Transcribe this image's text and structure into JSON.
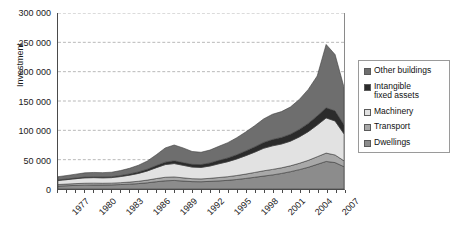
{
  "chart_data": {
    "type": "area",
    "stacked": true,
    "title": "",
    "xlabel": "",
    "ylabel": "Investment",
    "ylim": [
      0,
      300000
    ],
    "ytick_step": 50000,
    "ytick_labels": [
      "300 000",
      "250 000",
      "200 000",
      "150 000",
      "100 000",
      "50 000",
      "0"
    ],
    "ytick_values": [
      300000,
      250000,
      200000,
      150000,
      100000,
      50000,
      0
    ],
    "grid": true,
    "grid_style": "dashed",
    "legend_position": "right",
    "xlim": [
      1977,
      2009
    ],
    "xtick_label_step": 3,
    "x": [
      1977,
      1978,
      1979,
      1980,
      1981,
      1982,
      1983,
      1984,
      1985,
      1986,
      1987,
      1988,
      1989,
      1990,
      1991,
      1992,
      1993,
      1994,
      1995,
      1996,
      1997,
      1998,
      1999,
      2000,
      2001,
      2002,
      2003,
      2004,
      2005,
      2006,
      2007,
      2008,
      2009
    ],
    "xtick_labels": [
      "1977",
      "1980",
      "1983",
      "1986",
      "1989",
      "1992",
      "1995",
      "1998",
      "2001",
      "2004",
      "2007"
    ],
    "series": [
      {
        "name": "Dwellings",
        "color": "#8c8c8c",
        "values": [
          5000,
          5600,
          6200,
          6600,
          6800,
          6800,
          7000,
          7600,
          8200,
          9200,
          10600,
          12400,
          14000,
          14600,
          13600,
          12600,
          12400,
          13000,
          13800,
          14800,
          16200,
          18000,
          20000,
          22000,
          24000,
          26500,
          29500,
          33000,
          37000,
          42000,
          47000,
          45000,
          38000
        ]
      },
      {
        "name": "Transport",
        "color": "#a8a8a8",
        "values": [
          2600,
          2800,
          3000,
          3200,
          3200,
          3000,
          3000,
          3200,
          3600,
          4000,
          4600,
          5400,
          6000,
          6000,
          5400,
          5000,
          4800,
          5200,
          5800,
          6200,
          6800,
          7400,
          8200,
          9000,
          9400,
          9600,
          10000,
          10800,
          11800,
          13000,
          14200,
          13000,
          10000
        ]
      },
      {
        "name": "Machinery",
        "color": "#e2e2e2",
        "values": [
          7000,
          7600,
          8400,
          9200,
          9400,
          9200,
          9400,
          10400,
          11800,
          13400,
          15600,
          18600,
          21600,
          22800,
          21400,
          19800,
          19600,
          21000,
          23400,
          25600,
          28200,
          31400,
          34600,
          38400,
          40200,
          40600,
          42000,
          45000,
          49000,
          54000,
          60000,
          58000,
          46000
        ]
      },
      {
        "name": "Intangible fixed assets",
        "color": "#2b2b2b",
        "values": [
          900,
          1000,
          1100,
          1300,
          1400,
          1500,
          1600,
          1800,
          2100,
          2500,
          3000,
          3600,
          4200,
          4600,
          4600,
          4600,
          4800,
          5200,
          5800,
          6400,
          7200,
          8000,
          9000,
          10000,
          10800,
          11200,
          11800,
          12800,
          14000,
          15600,
          17200,
          17200,
          15600
        ]
      },
      {
        "name": "Other buildings",
        "color": "#6e6e6e",
        "values": [
          5500,
          6000,
          6600,
          7200,
          7400,
          7400,
          7600,
          8400,
          9600,
          11400,
          14000,
          18400,
          24200,
          27000,
          25000,
          22000,
          21000,
          22000,
          24000,
          26000,
          29000,
          32400,
          36000,
          40000,
          43000,
          44000,
          46500,
          51000,
          58000,
          68000,
          108000,
          96000,
          64000
        ]
      }
    ]
  },
  "legend": {
    "items": [
      {
        "label": "Other buildings"
      },
      {
        "label": "Intangible\nfixed assets"
      },
      {
        "label": "Machinery"
      },
      {
        "label": "Transport"
      },
      {
        "label": "Dwellings"
      }
    ]
  }
}
